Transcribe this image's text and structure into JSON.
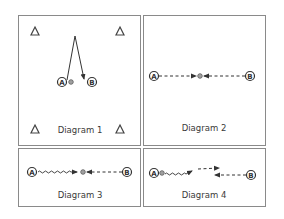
{
  "figure": {
    "panels": [
      {
        "id": "diagram-1",
        "label": "Diagram 1"
      },
      {
        "id": "diagram-2",
        "label": "Diagram 2"
      },
      {
        "id": "diagram-3",
        "label": "Diagram 3"
      },
      {
        "id": "diagram-4",
        "label": "Diagram 4"
      }
    ],
    "players": {
      "a": "A",
      "b": "B"
    },
    "colors": {
      "border": "#8a8a8a",
      "ink": "#333333",
      "background": "#ffffff"
    }
  }
}
